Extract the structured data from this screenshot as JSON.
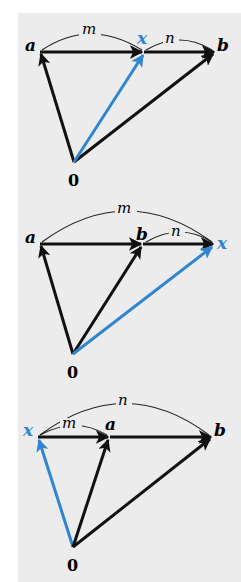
{
  "colors": {
    "background": "#ffffff",
    "panel": "#ececec",
    "vector": "#111111",
    "highlight_vector": "#2f86d0",
    "arc": "#222222"
  },
  "diagrams": [
    {
      "id": "x-between-a-and-b",
      "points": {
        "a": "a",
        "b": "b",
        "x": "x",
        "origin": "0"
      },
      "arcs": {
        "m": "m",
        "n": "n"
      },
      "description": "x lies between a and b; m spans a to x, n spans x to b"
    },
    {
      "id": "x-beyond-b",
      "points": {
        "a": "a",
        "b": "b",
        "x": "x",
        "origin": "0"
      },
      "arcs": {
        "m": "m",
        "n": "n"
      },
      "description": "x lies beyond b; m spans a to x, n spans b to x"
    },
    {
      "id": "x-before-a",
      "points": {
        "a": "a",
        "b": "b",
        "x": "x",
        "origin": "0"
      },
      "arcs": {
        "m": "m",
        "n": "n"
      },
      "description": "x lies before a; m spans x to a, n spans x to b"
    }
  ]
}
